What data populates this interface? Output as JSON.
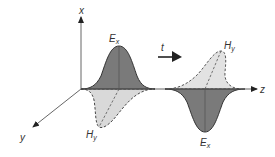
{
  "diagram": {
    "axes": {
      "x_label": "x",
      "y_label": "y",
      "z_label": "z"
    },
    "time_arrow": {
      "label": "t"
    },
    "pulses": [
      {
        "name": "first",
        "e_label": "E",
        "e_sub": "x",
        "h_label": "H",
        "h_sub": "y"
      },
      {
        "name": "second",
        "e_label": "E",
        "e_sub": "x",
        "h_label": "H",
        "h_sub": "y"
      }
    ],
    "colors": {
      "e_field_fill": "#7a7a7a",
      "h_field_fill": "#d9d9d9",
      "axis": "#555555",
      "outline": "#333333"
    }
  }
}
